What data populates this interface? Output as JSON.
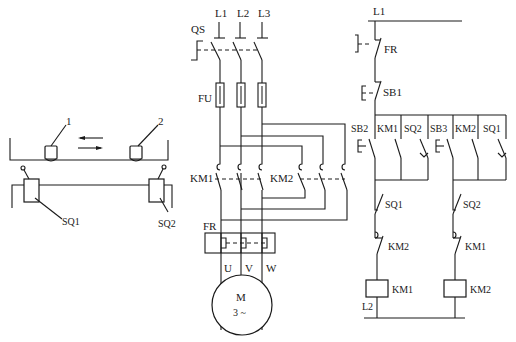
{
  "header_fragment": "(b) ...",
  "mechanical": {
    "part1_label": "1",
    "part2_label": "2",
    "switch1_label": "SQ1",
    "switch2_label": "SQ2",
    "arrow_left": "←",
    "arrow_right": "→"
  },
  "main_circuit": {
    "supply_labels": [
      "L1",
      "L2",
      "L3"
    ],
    "isolator_label": "QS",
    "fuse_label": "FU",
    "contactor1_label": "KM1",
    "contactor2_label": "KM2",
    "overload_label": "FR",
    "motor_terminals": [
      "U",
      "V",
      "W"
    ],
    "motor_label": "M",
    "motor_sub": "3 ~"
  },
  "control_circuit": {
    "top_supply": "L1",
    "bottom_supply": "L2",
    "overload_contact": "FR",
    "stop_button": "SB1",
    "branch1": {
      "start_button": "SB2",
      "hold_contact": "KM1",
      "limit_contact": "SQ2",
      "limit_nc": "SQ1",
      "interlock": "KM2",
      "coil": "KM1"
    },
    "branch2": {
      "start_button": "SB3",
      "hold_contact": "KM2",
      "limit_contact": "SQ1",
      "limit_nc": "SQ2",
      "interlock": "KM1",
      "coil": "KM2"
    }
  }
}
